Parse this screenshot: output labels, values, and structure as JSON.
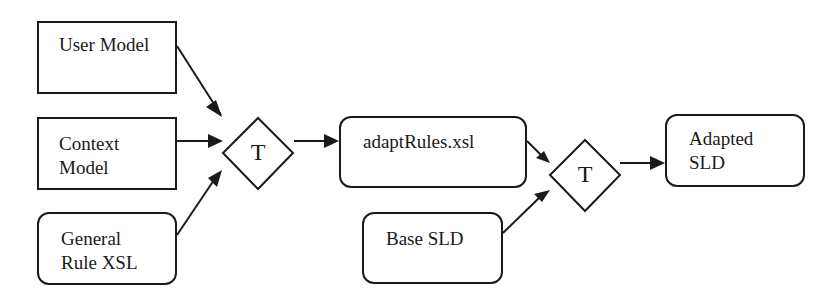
{
  "diagram": {
    "nodes": [
      {
        "id": "user_model",
        "label": "User Model",
        "shape": "rectangle"
      },
      {
        "id": "context_model",
        "label": "Context\nModel",
        "shape": "rectangle"
      },
      {
        "id": "general_rule_xsl",
        "label": "General\nRule XSL",
        "shape": "rounded-rectangle"
      },
      {
        "id": "transform_1",
        "label": "T",
        "shape": "diamond"
      },
      {
        "id": "adapt_rules_xsl",
        "label": "adaptRules.xsl",
        "shape": "rounded-rectangle"
      },
      {
        "id": "base_sld",
        "label": "Base SLD",
        "shape": "rounded-rectangle"
      },
      {
        "id": "transform_2",
        "label": "T",
        "shape": "diamond"
      },
      {
        "id": "adapted_sld",
        "label": "Adapted\nSLD",
        "shape": "rounded-rectangle"
      }
    ],
    "edges": [
      {
        "from": "user_model",
        "to": "transform_1"
      },
      {
        "from": "context_model",
        "to": "transform_1"
      },
      {
        "from": "general_rule_xsl",
        "to": "transform_1"
      },
      {
        "from": "transform_1",
        "to": "adapt_rules_xsl"
      },
      {
        "from": "adapt_rules_xsl",
        "to": "transform_2"
      },
      {
        "from": "base_sld",
        "to": "transform_2"
      },
      {
        "from": "transform_2",
        "to": "adapted_sld"
      }
    ],
    "colors": {
      "stroke": "#1a1a1a",
      "background": "#ffffff"
    }
  }
}
